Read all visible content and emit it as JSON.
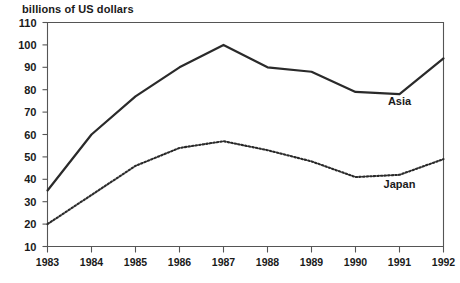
{
  "chart_data": {
    "type": "line",
    "title": "billions of US dollars",
    "xlabel": "",
    "ylabel": "billions of US dollars",
    "categories": [
      "1983",
      "1984",
      "1985",
      "1986",
      "1987",
      "1988",
      "1989",
      "1990",
      "1991",
      "1992"
    ],
    "x": [
      1983,
      1984,
      1985,
      1986,
      1987,
      1988,
      1989,
      1990,
      1991,
      1992
    ],
    "xlim": [
      1983,
      1992
    ],
    "ylim": [
      10,
      110
    ],
    "yticks": [
      10,
      20,
      30,
      40,
      50,
      60,
      70,
      80,
      90,
      100,
      110
    ],
    "ytick_labels": [
      "10",
      "20",
      "30",
      "40",
      "50",
      "60",
      "70",
      "80",
      "90",
      "100",
      "110"
    ],
    "grid": false,
    "legend_position": "inline-annotation",
    "series": [
      {
        "name": "Asia",
        "style": "solid",
        "color": "#2a2a2a",
        "values": [
          35,
          60,
          77,
          90,
          100,
          90,
          88,
          79,
          78,
          94
        ],
        "label_x": 1991,
        "label_y": 73
      },
      {
        "name": "Japan",
        "style": "dotted",
        "color": "#2a2a2a",
        "values": [
          20,
          33,
          46,
          54,
          57,
          53,
          48,
          41,
          42,
          49
        ],
        "label_x": 1991,
        "label_y": 36
      }
    ],
    "annotations": [
      {
        "text": "Asia",
        "series": "Asia"
      },
      {
        "text": "Japan",
        "series": "Japan"
      }
    ]
  }
}
